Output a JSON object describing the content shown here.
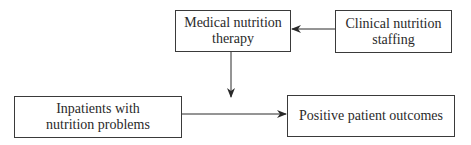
{
  "diagram": {
    "nodes": [
      {
        "id": "mnt",
        "label": "Medical nutrition therapy",
        "lines": [
          "Medical nutrition",
          "therapy"
        ]
      },
      {
        "id": "staffing",
        "label": "Clinical nutrition staffing",
        "lines": [
          "Clinical nutrition",
          "staffing"
        ]
      },
      {
        "id": "inpatients",
        "label": "Inpatients with nutrition problems",
        "lines": [
          "Inpatients with",
          "nutrition problems"
        ]
      },
      {
        "id": "outcomes",
        "label": "Positive patient outcomes",
        "lines": [
          "Positive patient outcomes"
        ]
      }
    ],
    "edges": [
      {
        "from": "staffing",
        "to": "mnt"
      },
      {
        "from": "mnt",
        "to": "inpatients-outcomes-edge"
      },
      {
        "from": "inpatients",
        "to": "outcomes"
      }
    ]
  }
}
